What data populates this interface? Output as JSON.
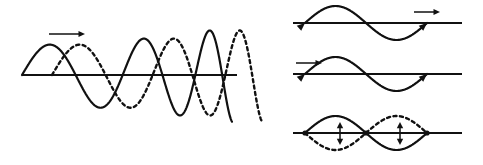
{
  "figure": {
    "background_color": "#ffffff",
    "stroke_color": "#111111",
    "width": 483,
    "height": 165
  },
  "chart_data": {
    "type": "line",
    "xlabel": "",
    "ylabel": "",
    "grid": false,
    "legend": "none",
    "panels": [
      {
        "id": "panel-left",
        "name": "traveling-wave-chirp-pair",
        "description": "Two identical chirped wavetrains, one solid and one dashed, the dashed one shifted to the right, drawn on a common horizontal axis with a rightward propagation arrow above the first crest",
        "axis": {
          "x_start": 22,
          "x_end": 237,
          "y": 75
        },
        "direction_arrow": {
          "name": "propagation-arrow-right",
          "label": "right",
          "x_start": 49,
          "x_end": 85,
          "y": 34
        },
        "series": [
          {
            "name": "wave-solid",
            "style": "solid",
            "x_start": 22,
            "x_end": 232,
            "baseline": 75,
            "phase_deg": 0,
            "amplitude_start": 30,
            "amplitude_end": 48,
            "wavelength_start": 112,
            "wavelength_end": 44
          },
          {
            "name": "wave-dashed",
            "style": "dashed",
            "x_start": 52,
            "x_end": 262,
            "baseline": 75,
            "phase_deg": 0,
            "amplitude_start": 30,
            "amplitude_end": 48,
            "wavelength_start": 112,
            "wavelength_end": 44
          }
        ]
      },
      {
        "id": "panel-right-top",
        "name": "wave-moving-right",
        "description": "Single full sine wave on a horizontal axis with arrowheads on the wave ends and a rightward direction arrow above the right end",
        "axis": {
          "x_start": 293,
          "x_end": 462,
          "y": 23
        },
        "direction_arrow": {
          "name": "propagation-arrow-right",
          "label": "right",
          "x_start": 414,
          "x_end": 440,
          "y": 12
        },
        "series": [
          {
            "name": "wave-solid",
            "style": "solid",
            "x_start": 305,
            "x_end": 427,
            "baseline": 23,
            "phase_deg": 0,
            "amplitude": 17,
            "wavelength": 122,
            "end_arrowheads": true
          }
        ]
      },
      {
        "id": "panel-right-middle",
        "name": "wave-moving-left",
        "description": "Single full sine wave on a horizontal axis with arrowheads on the wave ends and a leftward direction arrow above the left end",
        "axis": {
          "x_start": 293,
          "x_end": 462,
          "y": 74
        },
        "direction_arrow": {
          "name": "propagation-arrow-left",
          "label": "left",
          "x_start": 296,
          "x_end": 322,
          "y": 63
        },
        "series": [
          {
            "name": "wave-solid",
            "style": "solid",
            "x_start": 305,
            "x_end": 427,
            "baseline": 74,
            "phase_deg": 0,
            "amplitude": 17,
            "wavelength": 122,
            "end_arrowheads": true
          }
        ]
      },
      {
        "id": "panel-right-bottom",
        "name": "standing-wave",
        "description": "Standing wave with two loops: solid and dashed envelope curves crossing at a node in the middle, with vertical double-headed arrows at the two antinodes",
        "axis": {
          "x_start": 293,
          "x_end": 462,
          "y": 133
        },
        "series": [
          {
            "name": "wave-solid",
            "style": "solid",
            "x_start": 305,
            "x_end": 427,
            "baseline": 133,
            "phase_deg": 0,
            "amplitude": 17,
            "wavelength": 122
          },
          {
            "name": "wave-dashed",
            "style": "dashed",
            "x_start": 305,
            "x_end": 427,
            "baseline": 133,
            "phase_deg": 180,
            "amplitude": 17,
            "wavelength": 122
          }
        ],
        "nodes": [
          {
            "name": "node-left",
            "x": 305,
            "y": 133
          },
          {
            "name": "node-middle",
            "x": 366,
            "y": 133
          },
          {
            "name": "node-right",
            "x": 427,
            "y": 133
          }
        ],
        "antinode_arrows": [
          {
            "name": "antinode-arrow-left",
            "label": "vertical-double-arrow",
            "x": 340,
            "y_top": 122,
            "y_bottom": 145
          },
          {
            "name": "antinode-arrow-right",
            "label": "vertical-double-arrow",
            "x": 400,
            "y_top": 122,
            "y_bottom": 145
          }
        ]
      }
    ]
  }
}
